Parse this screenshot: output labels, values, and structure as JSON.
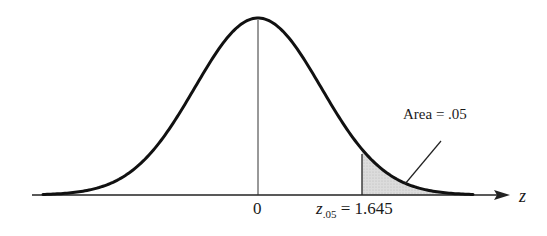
{
  "chart_data": {
    "type": "area",
    "title": "",
    "xlabel": "z",
    "ylabel": "",
    "x_ticks": [
      {
        "value": 0,
        "label": "0"
      },
      {
        "value": 1.645,
        "label": "z.05 = 1.645"
      }
    ],
    "shaded_region": {
      "from": 1.645,
      "to": "inf",
      "area": 0.05,
      "label": "Area = .05"
    },
    "distribution": {
      "name": "standard normal",
      "mean": 0,
      "sd": 1
    },
    "grid": false,
    "legend": null
  },
  "labels": {
    "zero": "0",
    "crit_symbol": "z",
    "crit_subscript": ".05",
    "crit_value": " = 1.645",
    "axis_name": "z",
    "area": "Area = .05"
  },
  "colors": {
    "curve": "#111111",
    "axis": "#222222",
    "shade": "#d4d4d4"
  }
}
